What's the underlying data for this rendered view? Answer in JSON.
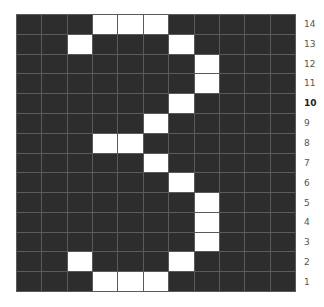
{
  "grid": {
    "columns": 11,
    "rows": 14,
    "on_color": "#ffffff",
    "off_color": "#2d2d2d",
    "line_color": "#5a5a5a",
    "row_labels": [
      "14",
      "13",
      "12",
      "11",
      "10",
      "9",
      "8",
      "7",
      "6",
      "5",
      "4",
      "3",
      "2",
      "1"
    ],
    "bold_label": "10",
    "pattern": [
      [
        0,
        0,
        0,
        1,
        1,
        1,
        0,
        0,
        0,
        0,
        0
      ],
      [
        0,
        0,
        1,
        0,
        0,
        0,
        1,
        0,
        0,
        0,
        0
      ],
      [
        0,
        0,
        0,
        0,
        0,
        0,
        0,
        1,
        0,
        0,
        0
      ],
      [
        0,
        0,
        0,
        0,
        0,
        0,
        0,
        1,
        0,
        0,
        0
      ],
      [
        0,
        0,
        0,
        0,
        0,
        0,
        1,
        0,
        0,
        0,
        0
      ],
      [
        0,
        0,
        0,
        0,
        0,
        1,
        0,
        0,
        0,
        0,
        0
      ],
      [
        0,
        0,
        0,
        1,
        1,
        0,
        0,
        0,
        0,
        0,
        0
      ],
      [
        0,
        0,
        0,
        0,
        0,
        1,
        0,
        0,
        0,
        0,
        0
      ],
      [
        0,
        0,
        0,
        0,
        0,
        0,
        1,
        0,
        0,
        0,
        0
      ],
      [
        0,
        0,
        0,
        0,
        0,
        0,
        0,
        1,
        0,
        0,
        0
      ],
      [
        0,
        0,
        0,
        0,
        0,
        0,
        0,
        1,
        0,
        0,
        0
      ],
      [
        0,
        0,
        0,
        0,
        0,
        0,
        0,
        1,
        0,
        0,
        0
      ],
      [
        0,
        0,
        1,
        0,
        0,
        0,
        1,
        0,
        0,
        0,
        0
      ],
      [
        0,
        0,
        0,
        1,
        1,
        1,
        0,
        0,
        0,
        0,
        0
      ]
    ]
  }
}
